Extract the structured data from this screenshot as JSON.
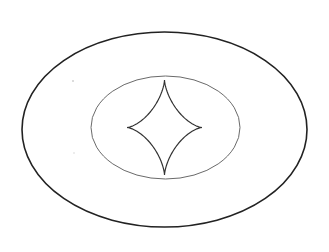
{
  "canvas": {
    "width": 329,
    "height": 252,
    "background": "#ffffff"
  },
  "diagram": {
    "outer_ellipse": {
      "cx": 164.5,
      "cy": 129.5,
      "rx": 142.5,
      "ry": 97.5,
      "stroke": "#222222",
      "stroke_width": 1.6
    },
    "inner_ellipse": {
      "cx": 165.5,
      "cy": 127.5,
      "rx": 74.5,
      "ry": 51.5,
      "stroke": "#6a6a6a",
      "stroke_width": 1.0
    },
    "astroid": {
      "cx": 164.5,
      "cy": 127.5,
      "a": 37.5,
      "b": 47.5,
      "stroke": "#333333",
      "stroke_width": 1.2
    },
    "specks": [
      {
        "x": 73,
        "y": 81,
        "r": 0.8,
        "color": "#b0b0b0"
      },
      {
        "x": 74,
        "y": 153,
        "r": 0.7,
        "color": "#cccccc"
      }
    ]
  }
}
